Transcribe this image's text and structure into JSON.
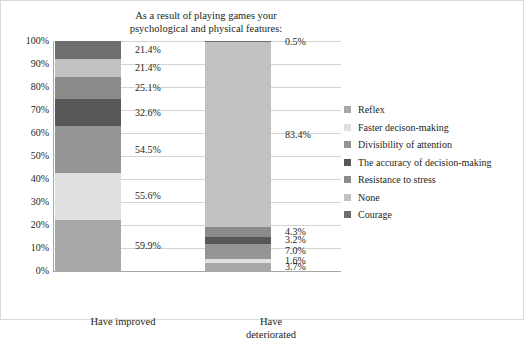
{
  "chart_data": {
    "type": "bar",
    "subtype": "stacked-100-percent",
    "title": "As a result of playing games your psychological and physical features:",
    "title_lines": [
      "As a result of playing games your",
      "psychological and physical features:"
    ],
    "xlabel": "",
    "ylabel": "",
    "ylim": [
      0,
      100
    ],
    "grid": true,
    "legend_position": "right",
    "categories": [
      "Have improved",
      "Have deteriorated"
    ],
    "category_lines": [
      [
        "Have improved"
      ],
      [
        "Have",
        "deteriorated"
      ]
    ],
    "ytick_labels": [
      "0%",
      "10%",
      "20%",
      "30%",
      "40%",
      "50%",
      "60%",
      "70%",
      "80%",
      "90%",
      "100%"
    ],
    "ytick_values": [
      0,
      10,
      20,
      30,
      40,
      50,
      60,
      70,
      80,
      90,
      100
    ],
    "series": [
      {
        "name": "Reflex",
        "color": "#a8a8a8",
        "values": [
          59.9,
          3.7
        ],
        "labels": [
          "59.9%",
          "3.7%"
        ]
      },
      {
        "name": "Faster decison-making",
        "color": "#e0e0e0",
        "values": [
          55.6,
          1.6
        ],
        "labels": [
          "55.6%",
          "1.6%"
        ]
      },
      {
        "name": "Divisibility of attention",
        "color": "#959595",
        "values": [
          54.5,
          7.0
        ],
        "labels": [
          "54.5%",
          "7.0%"
        ]
      },
      {
        "name": "The accuracy of decision-making",
        "color": "#575757",
        "values": [
          32.6,
          3.2
        ],
        "labels": [
          "32.6%",
          "3.2%"
        ]
      },
      {
        "name": "Resistance to stress",
        "color": "#8a8a8a",
        "values": [
          25.1,
          4.3
        ],
        "labels": [
          "25.1%",
          "4.3%"
        ]
      },
      {
        "name": "None",
        "color": "#c2c2c2",
        "values": [
          21.4,
          83.4
        ],
        "labels": [
          "21.4%",
          "83.4%"
        ]
      },
      {
        "name": "Courage",
        "color": "#6e6e6e",
        "values": [
          21.4,
          0.5
        ],
        "labels": [
          "21.4%",
          "0.5%"
        ]
      }
    ]
  },
  "legend": {
    "items": [
      {
        "label": "Reflex",
        "color": "#a8a8a8"
      },
      {
        "label": "Faster decison-making",
        "color": "#e0e0e0"
      },
      {
        "label": "Divisibility of attention",
        "color": "#959595"
      },
      {
        "label": "The accuracy of decision-making",
        "color": "#575757"
      },
      {
        "label": "Resistance to stress",
        "color": "#8a8a8a"
      },
      {
        "label": "None",
        "color": "#c2c2c2"
      },
      {
        "label": "Courage",
        "color": "#6e6e6e"
      }
    ]
  },
  "colors": {
    "background": "#ffffff",
    "text": "#231f20",
    "gridline": "#d4d4d4",
    "axis": "#a6a6a6",
    "border": "#d9d9d9"
  }
}
